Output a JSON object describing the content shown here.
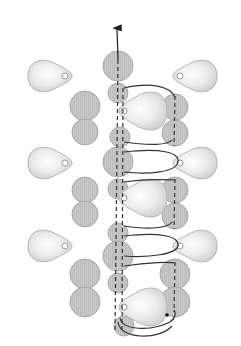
{
  "diagram": {
    "title": "",
    "type": "beading-stitch-path",
    "colors": {
      "background": "#ffffff",
      "round_bead_fill": "#c9c9c9",
      "round_bead_stroke": "#a8a8a8",
      "drop_bead_fill": "#e6e6e6",
      "drop_bead_highlight": "#ffffff",
      "drop_bead_stroke": "#b5b5b5",
      "thread": "#333333"
    },
    "round_beads": [
      {
        "cx": 118,
        "cy": 66,
        "r": 15
      },
      {
        "cx": 118,
        "cy": 93,
        "r": 10
      },
      {
        "cx": 85,
        "cy": 106,
        "r": 15
      },
      {
        "cx": 85,
        "cy": 132,
        "r": 13
      },
      {
        "cx": 120,
        "cy": 137,
        "r": 10
      },
      {
        "cx": 175,
        "cy": 107,
        "r": 13
      },
      {
        "cx": 175,
        "cy": 133,
        "r": 13
      },
      {
        "cx": 118,
        "cy": 162,
        "r": 15
      },
      {
        "cx": 118,
        "cy": 189,
        "r": 10
      },
      {
        "cx": 85,
        "cy": 190,
        "r": 13
      },
      {
        "cx": 85,
        "cy": 214,
        "r": 13
      },
      {
        "cx": 175,
        "cy": 190,
        "r": 13
      },
      {
        "cx": 175,
        "cy": 216,
        "r": 13
      },
      {
        "cx": 118,
        "cy": 233,
        "r": 10
      },
      {
        "cx": 118,
        "cy": 256,
        "r": 15
      },
      {
        "cx": 118,
        "cy": 283,
        "r": 10
      },
      {
        "cx": 85,
        "cy": 274,
        "r": 15
      },
      {
        "cx": 85,
        "cy": 302,
        "r": 15
      },
      {
        "cx": 175,
        "cy": 274,
        "r": 15
      },
      {
        "cx": 175,
        "cy": 302,
        "r": 15
      },
      {
        "cx": 124,
        "cy": 326,
        "r": 10
      }
    ],
    "drop_beads": [
      {
        "x": 50,
        "y": 76,
        "dir": "right"
      },
      {
        "x": 195,
        "y": 76,
        "dir": "left"
      },
      {
        "x": 50,
        "y": 163,
        "dir": "right"
      },
      {
        "x": 195,
        "y": 163,
        "dir": "left"
      },
      {
        "x": 50,
        "y": 246,
        "dir": "right"
      },
      {
        "x": 195,
        "y": 246,
        "dir": "left"
      },
      {
        "x": 143,
        "y": 111,
        "dir": "center"
      },
      {
        "x": 143,
        "y": 198,
        "dir": "center"
      },
      {
        "x": 143,
        "y": 307,
        "dir": "center"
      }
    ],
    "arrow": {
      "x": 118,
      "y_from": 58,
      "y_to": 28,
      "direction": "up"
    }
  }
}
